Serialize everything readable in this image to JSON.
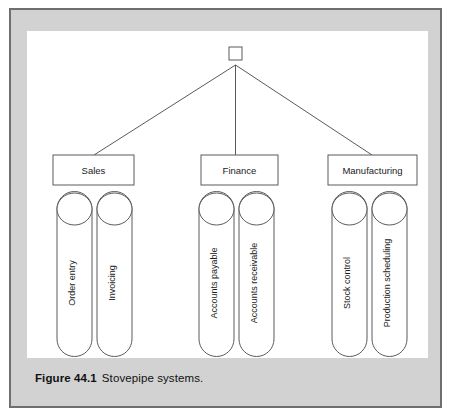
{
  "figure": {
    "caption_label": "Figure 44.1",
    "caption_text": "Stovepipe systems.",
    "colors": {
      "card_background": "#d2d2d2",
      "card_border": "#6f6f6f",
      "canvas_background": "#ffffff",
      "line": "#5a5a5a",
      "text": "#1b1b1b"
    }
  },
  "diagram": {
    "type": "tree",
    "root": {
      "name": "root-node",
      "label": "",
      "shape": "square"
    },
    "branches": [
      {
        "id": "sales",
        "label": "Sales",
        "pipes": [
          {
            "id": "order-entry",
            "label": "Order entry"
          },
          {
            "id": "invoicing",
            "label": "Invoicing"
          }
        ]
      },
      {
        "id": "finance",
        "label": "Finance",
        "pipes": [
          {
            "id": "accounts-payable",
            "label": "Accounts payable"
          },
          {
            "id": "accounts-receivable",
            "label": "Accounts receivable"
          }
        ]
      },
      {
        "id": "manufacturing",
        "label": "Manufacturing",
        "pipes": [
          {
            "id": "stock-control",
            "label": "Stock control"
          },
          {
            "id": "production-scheduling",
            "label": "Production scheduling"
          }
        ]
      }
    ]
  }
}
